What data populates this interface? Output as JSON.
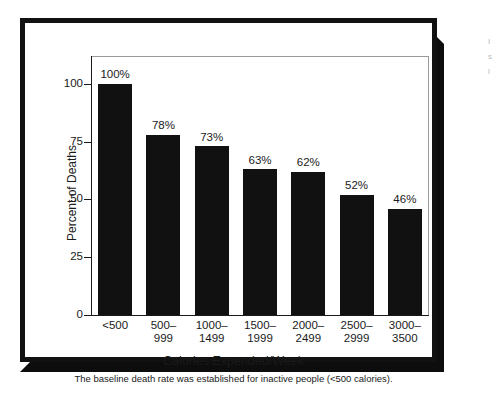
{
  "chart_data": {
    "type": "bar",
    "title": "",
    "xlabel": "Calories Expended/Week",
    "ylabel": "Percent of Deaths",
    "caption": "The baseline death rate was established for inactive people (<500 calories).",
    "categories": [
      "<500",
      "500–\n999",
      "1000–\n1499",
      "1500–\n1999",
      "2000–\n2499",
      "2500–\n2999",
      "3000–\n3500"
    ],
    "values": [
      100,
      78,
      73,
      63,
      62,
      52,
      46
    ],
    "value_labels": [
      "100%",
      "78%",
      "73%",
      "63%",
      "62%",
      "52%",
      "46%"
    ],
    "ylim": [
      0,
      112
    ],
    "yticks": [
      0,
      25,
      50,
      75,
      100
    ],
    "ytick_labels": [
      "0",
      "25",
      "50",
      "75",
      "100"
    ],
    "grid": false,
    "legend": false,
    "bar_color": "#111111",
    "frame_color": "#9a9a9a",
    "axis_color": "#1a1a1a",
    "background": "#ffffff"
  }
}
